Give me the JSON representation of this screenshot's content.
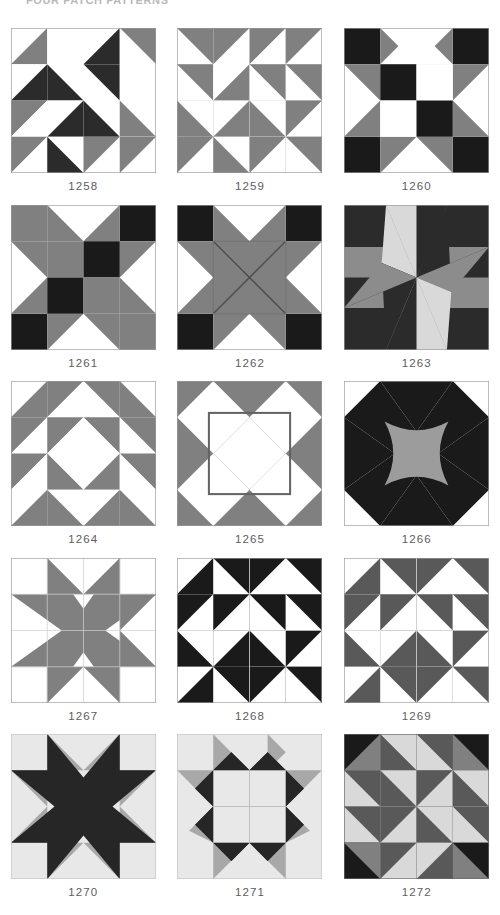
{
  "header": {
    "title": "FOUR PATCH PATTERNS"
  },
  "palette": {
    "white": "#ffffff",
    "light": "#e3e3e3",
    "light_gray": "#d9d9d9",
    "gray": "#808080",
    "mid_gray": "#8c8c8c",
    "dark_gray": "#595959",
    "dark": "#2b2b2b",
    "black": "#1a1a1a",
    "outline": "#9a9a9a",
    "caption_color": "#5d5d5d"
  },
  "grid": {
    "columns": 3,
    "rows": 5,
    "block_size": 145
  },
  "blocks": [
    {
      "id": "1258",
      "caption": "1258",
      "name": "eight-point-star-dark-white",
      "row": 1,
      "col": 1
    },
    {
      "id": "1259",
      "caption": "1259",
      "name": "gray-white-pinwheel-star",
      "row": 1,
      "col": 2
    },
    {
      "id": "1260",
      "caption": "1260",
      "name": "dark-corner-checkerboard-star",
      "row": 1,
      "col": 3
    },
    {
      "id": "1261",
      "caption": "1261",
      "name": "gray-dark-hourglass-nine-patch",
      "row": 2,
      "col": 1
    },
    {
      "id": "1262",
      "caption": "1262",
      "name": "gray-x-center-star",
      "row": 2,
      "col": 2
    },
    {
      "id": "1263",
      "caption": "1263",
      "name": "diamond-eight-point-star",
      "row": 2,
      "col": 3
    },
    {
      "id": "1264",
      "caption": "1264",
      "name": "triangle-diamond-center",
      "row": 3,
      "col": 1
    },
    {
      "id": "1265",
      "caption": "1265",
      "name": "white-diamonds-on-gray",
      "row": 3,
      "col": 2
    },
    {
      "id": "1266",
      "caption": "1266",
      "name": "curved-center-eight-point-star",
      "row": 3,
      "col": 3
    },
    {
      "id": "1267",
      "caption": "1267",
      "name": "gray-star-on-white",
      "row": 4,
      "col": 1
    },
    {
      "id": "1268",
      "caption": "1268",
      "name": "dark-white-pinwheel-grid",
      "row": 4,
      "col": 2
    },
    {
      "id": "1269",
      "caption": "1269",
      "name": "gray-white-pinwheel-grid",
      "row": 4,
      "col": 3
    },
    {
      "id": "1270",
      "caption": "1270",
      "name": "dark-sawtooth-star-light-ground",
      "row": 5,
      "col": 1
    },
    {
      "id": "1271",
      "caption": "1271",
      "name": "light-center-dark-ring-star",
      "row": 5,
      "col": 2
    },
    {
      "id": "1272",
      "caption": "1272",
      "name": "tri-tone-triangle-grid",
      "row": 5,
      "col": 3
    }
  ]
}
